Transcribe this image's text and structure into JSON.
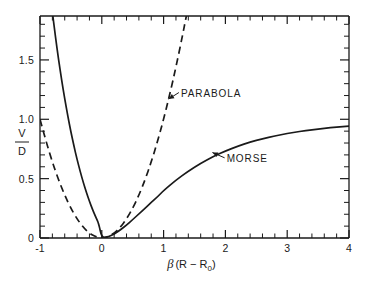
{
  "figure": {
    "background_color": "#ffffff",
    "line_color": "#1a1a1a"
  },
  "chart_data": {
    "type": "line",
    "title": "",
    "subtitle": "",
    "xlabel": "β (R − R₀)",
    "ylabel": "V/D",
    "ylabel_numerator": "V",
    "ylabel_denominator": "D",
    "xlim": [
      -1,
      4
    ],
    "ylim": [
      0,
      1.87
    ],
    "grid": false,
    "legend_position": "inline-annotations",
    "x_ticks_major": [
      "-1",
      "0",
      "1",
      "2",
      "3",
      "4"
    ],
    "x_tick_values": [
      -1,
      0,
      1,
      2,
      3,
      4
    ],
    "x_minor_tick_step": 0.2,
    "y_ticks_major": [
      "0",
      "0.5",
      "1.0",
      "1.5"
    ],
    "y_tick_values": [
      0,
      0.5,
      1.0,
      1.5
    ],
    "y_minor_tick_step": 0.1,
    "annotations": [
      {
        "text": "PARABOLA",
        "target_x": 1.08,
        "target_y": 1.17,
        "label_x": 1.28,
        "label_y": 1.2
      },
      {
        "text": "MORSE",
        "target_x": 1.79,
        "target_y": 0.72,
        "label_x": 2.02,
        "label_y": 0.65
      }
    ],
    "series": [
      {
        "name": "MORSE",
        "style": "solid",
        "formula": "V/D = (1 - exp(-x))^2",
        "x": [
          -1.0,
          -0.95,
          -0.9,
          -0.85,
          -0.8,
          -0.75,
          -0.7,
          -0.65,
          -0.6,
          -0.55,
          -0.5,
          -0.45,
          -0.4,
          -0.35,
          -0.3,
          -0.25,
          -0.2,
          -0.15,
          -0.1,
          -0.05,
          0.0,
          0.1,
          0.2,
          0.3,
          0.4,
          0.5,
          0.6,
          0.7,
          0.8,
          0.9,
          1.0,
          1.2,
          1.4,
          1.6,
          1.8,
          2.0,
          2.2,
          2.4,
          2.6,
          2.8,
          3.0,
          3.2,
          3.4,
          3.6,
          3.8,
          4.0
        ],
        "y": [
          2.952,
          2.653,
          2.38,
          2.131,
          1.903,
          1.695,
          1.505,
          1.331,
          1.172,
          1.027,
          0.894,
          0.773,
          0.662,
          0.561,
          0.469,
          0.385,
          0.309,
          0.24,
          0.178,
          0.122,
          0.0,
          0.009,
          0.033,
          0.068,
          0.109,
          0.155,
          0.203,
          0.251,
          0.3,
          0.346,
          0.4,
          0.487,
          0.563,
          0.629,
          0.685,
          0.733,
          0.773,
          0.808,
          0.836,
          0.86,
          0.88,
          0.897,
          0.911,
          0.924,
          0.934,
          0.943
        ]
      },
      {
        "name": "PARABOLA",
        "style": "dashed",
        "formula": "V/D = x^2",
        "x": [
          -1.0,
          -0.9,
          -0.8,
          -0.7,
          -0.6,
          -0.5,
          -0.4,
          -0.3,
          -0.2,
          -0.1,
          0.0,
          0.1,
          0.2,
          0.3,
          0.4,
          0.5,
          0.6,
          0.7,
          0.8,
          0.9,
          1.0,
          1.1,
          1.2,
          1.3,
          1.368
        ],
        "y": [
          1.0,
          0.81,
          0.64,
          0.49,
          0.36,
          0.25,
          0.16,
          0.09,
          0.04,
          0.01,
          0.0,
          0.01,
          0.04,
          0.09,
          0.16,
          0.25,
          0.36,
          0.49,
          0.64,
          0.81,
          1.0,
          1.21,
          1.44,
          1.69,
          1.87
        ]
      }
    ]
  }
}
